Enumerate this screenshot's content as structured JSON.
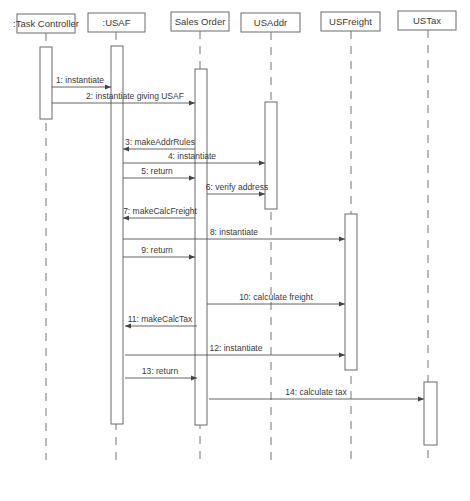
{
  "diagram": {
    "type": "uml-sequence-diagram",
    "participants": [
      {
        "id": "tc",
        "label": ":Task Controller",
        "x": 46,
        "box": [
          17,
          14,
          58,
          19
        ],
        "activation": [
          40,
          47,
          12,
          72
        ],
        "lifeline_end": 460
      },
      {
        "id": "usaf",
        "label": ":USAF",
        "x": 116,
        "box": [
          88,
          13,
          57,
          19
        ],
        "activation": [
          111,
          46,
          12,
          378
        ],
        "lifeline_end": 462
      },
      {
        "id": "so",
        "label": "Sales Order",
        "x": 200,
        "box": [
          171,
          12,
          58,
          19
        ],
        "activation": [
          195,
          69,
          12,
          356
        ],
        "lifeline_end": 462
      },
      {
        "id": "usaddr",
        "label": "USAddr",
        "x": 271,
        "box": [
          241,
          13,
          59,
          19
        ],
        "activation": [
          265,
          102,
          12,
          107
        ],
        "lifeline_end": 462
      },
      {
        "id": "usfreight",
        "label": "USFreight",
        "x": 351,
        "box": [
          321,
          12,
          59,
          19
        ],
        "activation": [
          345,
          214,
          12,
          156
        ],
        "lifeline_end": 462
      },
      {
        "id": "ustax",
        "label": "USTax",
        "x": 428,
        "box": [
          398,
          11,
          58,
          19
        ],
        "activation": [
          424,
          382,
          13,
          63
        ],
        "lifeline_end": 458
      }
    ],
    "messages": [
      {
        "n": 1,
        "label": "1: instantiate",
        "from_x": 52,
        "to_x": 111,
        "y": 87,
        "label_x": 80
      },
      {
        "n": 2,
        "label": "2: instantiate giving USAF",
        "from_x": 52,
        "to_x": 195,
        "y": 103,
        "label_x": 135
      },
      {
        "n": 3,
        "label": "3: makeAddrRules",
        "from_x": 195,
        "to_x": 123,
        "y": 149,
        "label_x": 160
      },
      {
        "n": 4,
        "label": "4: instantiate",
        "from_x": 123,
        "to_x": 265,
        "y": 163,
        "label_x": 192
      },
      {
        "n": 5,
        "label": "5: return",
        "from_x": 123,
        "to_x": 195,
        "y": 178,
        "label_x": 157
      },
      {
        "n": 6,
        "label": "6: verify address",
        "from_x": 207,
        "to_x": 265,
        "y": 194,
        "label_x": 237
      },
      {
        "n": 7,
        "label": "7: makeCalcFreight",
        "from_x": 195,
        "to_x": 123,
        "y": 218,
        "label_x": 160
      },
      {
        "n": 8,
        "label": "8: instantiate",
        "from_x": 123,
        "to_x": 345,
        "y": 239,
        "label_x": 234
      },
      {
        "n": 9,
        "label": "9: return",
        "from_x": 123,
        "to_x": 195,
        "y": 257,
        "label_x": 157
      },
      {
        "n": 10,
        "label": "10: calculate freight",
        "from_x": 207,
        "to_x": 345,
        "y": 304,
        "label_x": 276
      },
      {
        "n": 11,
        "label": "11: makeCalcTax",
        "from_x": 197,
        "to_x": 125,
        "y": 326,
        "label_x": 160
      },
      {
        "n": 12,
        "label": "12: instantiate",
        "from_x": 125,
        "to_x": 345,
        "y": 355,
        "label_x": 236
      },
      {
        "n": 13,
        "label": "13: return",
        "from_x": 125,
        "to_x": 197,
        "y": 378,
        "label_x": 160
      },
      {
        "n": 14,
        "label": "14: calculate tax",
        "from_x": 209,
        "to_x": 424,
        "y": 399,
        "label_x": 316
      }
    ]
  }
}
